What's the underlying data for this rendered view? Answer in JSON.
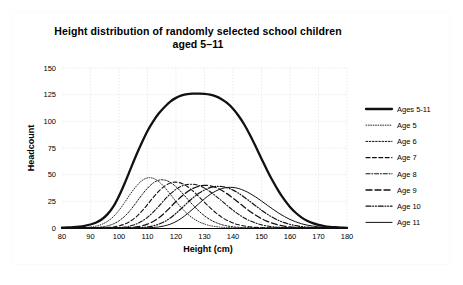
{
  "chart_data": {
    "type": "line",
    "title": "Height distribution of randomly selected school children aged 5–11",
    "title_line1": "Height distribution of randomly selected school children",
    "title_line2": "aged 5–11",
    "xlabel": "Height (cm)",
    "ylabel": "Headcount",
    "xlim": [
      80,
      180
    ],
    "ylim": [
      0,
      150
    ],
    "xticks": [
      80,
      90,
      100,
      110,
      120,
      130,
      140,
      150,
      160,
      170,
      180
    ],
    "yticks": [
      0,
      25,
      50,
      75,
      100,
      125,
      150
    ],
    "xtick_labels": [
      "80",
      "90",
      "100",
      "110",
      "120",
      "130",
      "140",
      "150",
      "160",
      "170",
      "180"
    ],
    "ytick_labels": [
      "0",
      "25",
      "50",
      "75",
      "100",
      "125",
      "150"
    ],
    "grid": true,
    "legend_position": "right",
    "x": [
      80,
      82,
      84,
      86,
      88,
      90,
      92,
      94,
      96,
      98,
      100,
      102,
      104,
      106,
      108,
      110,
      112,
      114,
      116,
      118,
      120,
      122,
      124,
      126,
      128,
      130,
      132,
      134,
      136,
      138,
      140,
      142,
      144,
      146,
      148,
      150,
      152,
      154,
      156,
      158,
      160,
      162,
      164,
      166,
      168,
      170,
      172,
      174,
      176,
      178,
      180
    ],
    "series": [
      {
        "name": "Ages 5-11",
        "line_style": "solid-thick",
        "stroke_width": 2.3,
        "dash": "none",
        "peak_x": 130,
        "peak_y": 126,
        "values": [
          0.3,
          0.5,
          0.8,
          1.3,
          2.1,
          3.3,
          5.2,
          8.2,
          13.0,
          20.0,
          30.0,
          42.0,
          55.0,
          68.0,
          80.0,
          91.0,
          100.0,
          107.5,
          113.5,
          118.5,
          122.0,
          124.3,
          125.6,
          126.0,
          126.0,
          125.8,
          125.0,
          123.4,
          120.8,
          117.0,
          111.8,
          105.0,
          96.8,
          87.0,
          76.2,
          65.0,
          54.0,
          43.8,
          34.6,
          26.6,
          19.8,
          14.3,
          10.0,
          6.8,
          4.5,
          2.9,
          1.8,
          1.1,
          0.7,
          0.4,
          0.2
        ]
      },
      {
        "name": "Age 5",
        "line_style": "fine-dotted",
        "stroke_width": 0.9,
        "dash": "0.8 1.6",
        "peak_x": 110,
        "peak_y": 47,
        "values": [
          0.0,
          0.0,
          0.1,
          0.2,
          0.4,
          0.9,
          1.8,
          3.5,
          6.3,
          10.6,
          16.6,
          24.0,
          31.9,
          39.0,
          44.3,
          47.0,
          46.6,
          43.4,
          38.1,
          31.6,
          24.9,
          18.6,
          13.3,
          9.1,
          5.9,
          3.7,
          2.2,
          1.3,
          0.7,
          0.4,
          0.2,
          0.1,
          0.0,
          0.0,
          0.0,
          0.0,
          0.0,
          0.0,
          0.0,
          0.0,
          0.0,
          0.0,
          0.0,
          0.0,
          0.0,
          0.0,
          0.0,
          0.0,
          0.0,
          0.0,
          0.0
        ]
      },
      {
        "name": "Age 6",
        "line_style": "dotted",
        "stroke_width": 1.0,
        "dash": "1.6 1.6",
        "peak_x": 116,
        "peak_y": 45,
        "values": [
          0.0,
          0.0,
          0.0,
          0.0,
          0.1,
          0.2,
          0.5,
          1.0,
          2.0,
          3.8,
          6.7,
          11.0,
          16.8,
          23.7,
          30.9,
          37.3,
          42.2,
          44.8,
          45.0,
          42.8,
          38.7,
          33.3,
          27.3,
          21.4,
          16.0,
          11.4,
          7.8,
          5.1,
          3.2,
          1.9,
          1.1,
          0.6,
          0.3,
          0.2,
          0.1,
          0.0,
          0.0,
          0.0,
          0.0,
          0.0,
          0.0,
          0.0,
          0.0,
          0.0,
          0.0,
          0.0,
          0.0,
          0.0,
          0.0,
          0.0,
          0.0
        ]
      },
      {
        "name": "Age 7",
        "line_style": "dashed",
        "stroke_width": 1.1,
        "dash": "4 2.4",
        "peak_x": 122,
        "peak_y": 43,
        "values": [
          0.0,
          0.0,
          0.0,
          0.0,
          0.0,
          0.0,
          0.1,
          0.2,
          0.5,
          1.0,
          2.0,
          3.7,
          6.4,
          10.4,
          15.8,
          22.0,
          28.6,
          34.6,
          39.3,
          42.2,
          43.0,
          41.8,
          38.9,
          34.6,
          29.5,
          24.1,
          18.9,
          14.2,
          10.2,
          7.1,
          4.7,
          3.0,
          1.9,
          1.1,
          0.6,
          0.3,
          0.2,
          0.1,
          0.0,
          0.0,
          0.0,
          0.0,
          0.0,
          0.0,
          0.0,
          0.0,
          0.0,
          0.0,
          0.0,
          0.0,
          0.0
        ]
      },
      {
        "name": "Age 8",
        "line_style": "dash-dot",
        "stroke_width": 1.1,
        "dash": "4 1.8 1 1.8",
        "peak_x": 128,
        "peak_y": 41,
        "values": [
          0.0,
          0.0,
          0.0,
          0.0,
          0.0,
          0.0,
          0.0,
          0.0,
          0.1,
          0.2,
          0.5,
          1.0,
          2.0,
          3.7,
          6.3,
          10.0,
          14.9,
          20.6,
          26.5,
          31.9,
          36.3,
          39.3,
          40.8,
          41.0,
          39.8,
          37.4,
          34.0,
          29.9,
          25.5,
          21.0,
          16.7,
          12.8,
          9.4,
          6.7,
          4.6,
          3.0,
          1.9,
          1.2,
          0.7,
          0.4,
          0.2,
          0.1,
          0.0,
          0.0,
          0.0,
          0.0,
          0.0,
          0.0,
          0.0,
          0.0,
          0.0
        ]
      },
      {
        "name": "Age 9",
        "line_style": "long-dash",
        "stroke_width": 1.3,
        "dash": "6 3",
        "peak_x": 134,
        "peak_y": 40,
        "values": [
          0.0,
          0.0,
          0.0,
          0.0,
          0.0,
          0.0,
          0.0,
          0.0,
          0.0,
          0.0,
          0.1,
          0.2,
          0.5,
          1.0,
          2.0,
          3.6,
          6.1,
          9.6,
          14.2,
          19.4,
          24.8,
          29.8,
          34.0,
          37.2,
          39.2,
          40.0,
          39.6,
          38.0,
          35.4,
          32.0,
          28.0,
          23.8,
          19.5,
          15.5,
          11.9,
          8.8,
          6.3,
          4.3,
          2.9,
          1.8,
          1.1,
          0.6,
          0.4,
          0.2,
          0.1,
          0.0,
          0.0,
          0.0,
          0.0,
          0.0,
          0.0
        ]
      },
      {
        "name": "Age 10",
        "line_style": "dash-dot-dot",
        "stroke_width": 1.2,
        "dash": "5 1.8 0.9 1.8 0.9 1.8",
        "peak_x": 140,
        "peak_y": 39,
        "values": [
          0.0,
          0.0,
          0.0,
          0.0,
          0.0,
          0.0,
          0.0,
          0.0,
          0.0,
          0.0,
          0.0,
          0.0,
          0.1,
          0.2,
          0.5,
          1.0,
          2.0,
          3.6,
          6.0,
          9.4,
          13.7,
          18.6,
          23.7,
          28.4,
          32.5,
          35.7,
          37.9,
          39.0,
          38.9,
          37.7,
          35.5,
          32.5,
          28.8,
          24.8,
          20.7,
          16.7,
          13.0,
          9.8,
          7.1,
          5.0,
          3.4,
          2.2,
          1.4,
          0.8,
          0.5,
          0.3,
          0.1,
          0.1,
          0.0,
          0.0,
          0.0
        ]
      },
      {
        "name": "Age 11",
        "line_style": "solid-thin",
        "stroke_width": 1.0,
        "dash": "none",
        "peak_x": 146,
        "peak_y": 38,
        "values": [
          0.0,
          0.0,
          0.0,
          0.0,
          0.0,
          0.0,
          0.0,
          0.0,
          0.0,
          0.0,
          0.0,
          0.0,
          0.0,
          0.0,
          0.1,
          0.2,
          0.5,
          1.0,
          2.0,
          3.6,
          6.0,
          9.3,
          13.4,
          18.0,
          22.8,
          27.4,
          31.5,
          34.7,
          36.9,
          38.0,
          38.0,
          37.0,
          35.0,
          32.3,
          29.0,
          25.3,
          21.4,
          17.6,
          14.0,
          10.8,
          8.0,
          5.8,
          4.0,
          2.7,
          1.8,
          1.1,
          0.7,
          0.4,
          0.2,
          0.1,
          0.1
        ]
      }
    ]
  },
  "legend": {
    "items": [
      {
        "label": "Ages 5-11"
      },
      {
        "label": "Age 5"
      },
      {
        "label": "Age 6"
      },
      {
        "label": "Age 7"
      },
      {
        "label": "Age 8"
      },
      {
        "label": "Age 9"
      },
      {
        "label": "Age 10"
      },
      {
        "label": "Age 11"
      }
    ]
  },
  "colors": {
    "line": "#111111",
    "grid": "#e2e2e2",
    "axis": "#000000",
    "background": "#ffffff"
  }
}
